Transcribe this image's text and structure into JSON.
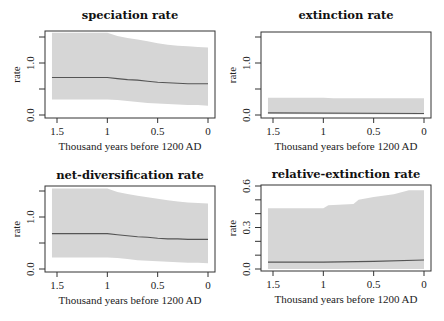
{
  "chart_data": [
    {
      "type": "area",
      "title": "speciation rate",
      "xlabel": "Thousand years before 1200 AD",
      "ylabel": "rate",
      "xlim": [
        1.55,
        0
      ],
      "ylim": [
        0.0,
        1.6
      ],
      "xticks": [
        "1.5",
        "1",
        "0.5",
        "0"
      ],
      "yticks": [
        "0.0",
        "",
        "1.0",
        ""
      ],
      "ytick_values": [
        0.0,
        0.5,
        1.0,
        1.5
      ],
      "grid": false,
      "series": [
        {
          "name": "median",
          "x": [
            1.55,
            1.0,
            0.9,
            0.8,
            0.7,
            0.6,
            0.5,
            0.4,
            0.3,
            0.2,
            0.1,
            0.0
          ],
          "values": [
            0.72,
            0.72,
            0.7,
            0.68,
            0.67,
            0.65,
            0.63,
            0.62,
            0.61,
            0.6,
            0.6,
            0.6
          ]
        },
        {
          "name": "upper 95% HPD",
          "x": [
            1.55,
            1.0,
            0.9,
            0.8,
            0.7,
            0.6,
            0.5,
            0.4,
            0.3,
            0.2,
            0.1,
            0.0
          ],
          "values": [
            1.58,
            1.58,
            1.52,
            1.48,
            1.45,
            1.42,
            1.38,
            1.35,
            1.33,
            1.32,
            1.31,
            1.3
          ]
        },
        {
          "name": "lower 95% HPD",
          "x": [
            1.55,
            1.0,
            0.9,
            0.8,
            0.7,
            0.6,
            0.5,
            0.4,
            0.3,
            0.2,
            0.1,
            0.0
          ],
          "values": [
            0.3,
            0.3,
            0.29,
            0.27,
            0.25,
            0.23,
            0.22,
            0.21,
            0.2,
            0.19,
            0.19,
            0.18
          ]
        }
      ]
    },
    {
      "type": "area",
      "title": "extinction rate",
      "xlabel": "Thousand years before 1200 AD",
      "ylabel": "rate",
      "xlim": [
        1.55,
        0
      ],
      "ylim": [
        0.0,
        1.6
      ],
      "xticks": [
        "1.5",
        "1",
        "0.5",
        "0"
      ],
      "yticks": [
        "0.0",
        "",
        "1.0",
        ""
      ],
      "ytick_values": [
        0.0,
        0.5,
        1.0,
        1.5
      ],
      "grid": false,
      "series": [
        {
          "name": "median",
          "x": [
            1.55,
            0.0
          ],
          "values": [
            0.04,
            0.03
          ]
        },
        {
          "name": "upper 95% HPD",
          "x": [
            1.55,
            1.0,
            0.9,
            0.0
          ],
          "values": [
            0.33,
            0.33,
            0.32,
            0.32
          ]
        },
        {
          "name": "lower 95% HPD",
          "x": [
            1.55,
            0.0
          ],
          "values": [
            0.02,
            0.01
          ]
        }
      ]
    },
    {
      "type": "area",
      "title": "net-diversification rate",
      "xlabel": "Thousand years before 1200 AD",
      "ylabel": "rate",
      "xlim": [
        1.55,
        0
      ],
      "ylim": [
        0.0,
        1.6
      ],
      "xticks": [
        "1.5",
        "1",
        "0.5",
        "0"
      ],
      "yticks": [
        "0.0",
        "",
        "1.0",
        ""
      ],
      "ytick_values": [
        0.0,
        0.5,
        1.0,
        1.5
      ],
      "grid": false,
      "series": [
        {
          "name": "median",
          "x": [
            1.55,
            1.0,
            0.9,
            0.8,
            0.7,
            0.6,
            0.5,
            0.4,
            0.3,
            0.2,
            0.1,
            0.0
          ],
          "values": [
            0.68,
            0.68,
            0.66,
            0.64,
            0.62,
            0.61,
            0.59,
            0.58,
            0.58,
            0.57,
            0.57,
            0.57
          ]
        },
        {
          "name": "upper 95% HPD",
          "x": [
            1.55,
            1.0,
            0.9,
            0.8,
            0.7,
            0.6,
            0.5,
            0.4,
            0.3,
            0.2,
            0.1,
            0.0
          ],
          "values": [
            1.55,
            1.55,
            1.48,
            1.44,
            1.41,
            1.38,
            1.35,
            1.32,
            1.3,
            1.28,
            1.27,
            1.26
          ]
        },
        {
          "name": "lower 95% HPD",
          "x": [
            1.55,
            1.0,
            0.9,
            0.8,
            0.7,
            0.6,
            0.5,
            0.4,
            0.3,
            0.2,
            0.1,
            0.0
          ],
          "values": [
            0.22,
            0.22,
            0.21,
            0.19,
            0.17,
            0.16,
            0.15,
            0.14,
            0.13,
            0.12,
            0.12,
            0.11
          ]
        }
      ]
    },
    {
      "type": "area",
      "title": "relative-extinction rate",
      "xlabel": "Thousand years before 1200 AD",
      "ylabel": "rate",
      "xlim": [
        1.55,
        0
      ],
      "ylim": [
        0.0,
        0.6
      ],
      "xticks": [
        "1.5",
        "1",
        "0.5",
        "0"
      ],
      "yticks": [
        "0.0",
        "",
        "",
        "0.3",
        "",
        "",
        "0.6"
      ],
      "ytick_values": [
        0.0,
        0.1,
        0.2,
        0.3,
        0.4,
        0.5,
        0.6
      ],
      "grid": false,
      "series": [
        {
          "name": "median",
          "x": [
            1.55,
            1.0,
            0.5,
            0.0
          ],
          "values": [
            0.05,
            0.05,
            0.055,
            0.065
          ]
        },
        {
          "name": "upper 95% HPD",
          "x": [
            1.55,
            1.0,
            0.95,
            0.7,
            0.65,
            0.5,
            0.3,
            0.15,
            0.0
          ],
          "values": [
            0.44,
            0.44,
            0.46,
            0.47,
            0.5,
            0.52,
            0.54,
            0.57,
            0.57
          ]
        },
        {
          "name": "lower 95% HPD",
          "x": [
            1.55,
            0.0
          ],
          "values": [
            0.0,
            0.0
          ]
        }
      ]
    }
  ],
  "panels": [
    {
      "title": "speciation rate",
      "ylabel": "rate",
      "xlabel": "Thousand years before 1200 AD"
    },
    {
      "title": "extinction rate",
      "ylabel": "rate",
      "xlabel": "Thousand years before 1200 AD"
    },
    {
      "title": "net-diversification rate",
      "ylabel": "rate",
      "xlabel": "Thousand years before 1200 AD"
    },
    {
      "title": "relative-extinction rate",
      "ylabel": "rate",
      "xlabel": "Thousand years before 1200 AD"
    }
  ],
  "colors": {
    "band": "#d6d6d6",
    "median": "#555555",
    "axis": "#333333"
  }
}
